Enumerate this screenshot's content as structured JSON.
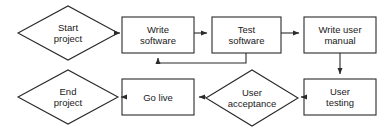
{
  "diagram": {
    "type": "flowchart",
    "background_color": "#ffffff",
    "stroke_color": "#2b2b2b",
    "text_color": "#1a1a1a",
    "nodes": [
      {
        "id": "start-project",
        "label": "Start\nproject",
        "shape": "diamond",
        "x": 18,
        "y": 6,
        "width": 100,
        "height": 54
      },
      {
        "id": "write-software",
        "label": "Write\nsoftware",
        "shape": "rectangle",
        "x": 122,
        "y": 17,
        "width": 72,
        "height": 36
      },
      {
        "id": "test-software",
        "label": "Test\nsoftware",
        "shape": "rectangle",
        "x": 212,
        "y": 17,
        "width": 69,
        "height": 36
      },
      {
        "id": "write-user-manual",
        "label": "Write user\nmanual",
        "shape": "rectangle",
        "x": 304,
        "y": 17,
        "width": 72,
        "height": 36
      },
      {
        "id": "user-testing",
        "label": "User\ntesting",
        "shape": "rectangle",
        "x": 304,
        "y": 79,
        "width": 72,
        "height": 36
      },
      {
        "id": "user-acceptance",
        "label": "User\nacceptance",
        "shape": "diamond",
        "x": 206,
        "y": 70,
        "width": 92,
        "height": 56
      },
      {
        "id": "go-live",
        "label": "Go live",
        "shape": "rectangle",
        "x": 122,
        "y": 79,
        "width": 72,
        "height": 36
      },
      {
        "id": "end-project",
        "label": "End\nproject",
        "shape": "diamond",
        "x": 18,
        "y": 70,
        "width": 100,
        "height": 54
      }
    ],
    "connectors": [
      {
        "id": "start-to-write",
        "from": "start-project",
        "to": "write-software",
        "direction": "right"
      },
      {
        "id": "write-to-test",
        "from": "write-software",
        "to": "test-software",
        "direction": "right"
      },
      {
        "id": "test-to-manual",
        "from": "test-software",
        "to": "write-user-manual",
        "direction": "right"
      },
      {
        "id": "test-back-to-write",
        "from": "test-software",
        "to": "write-software",
        "direction": "loop-back"
      },
      {
        "id": "manual-to-testing",
        "from": "write-user-manual",
        "to": "user-testing",
        "direction": "down"
      },
      {
        "id": "testing-to-acceptance",
        "from": "user-testing",
        "to": "user-acceptance",
        "direction": "left"
      },
      {
        "id": "acceptance-to-golive",
        "from": "user-acceptance",
        "to": "go-live",
        "direction": "left"
      },
      {
        "id": "golive-to-end",
        "from": "go-live",
        "to": "end-project",
        "direction": "left"
      }
    ]
  }
}
